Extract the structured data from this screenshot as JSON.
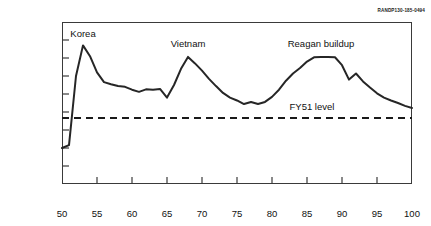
{
  "doc_code": "RANDP130-185-0494",
  "chart_data": {
    "type": "line",
    "title": "",
    "xlabel": "Fiscal year",
    "ylabel_line1": "National defense outlays",
    "ylabel_line2": "(billions, 1993$)",
    "xlim": [
      50,
      100
    ],
    "ylim": [
      0,
      450
    ],
    "xticks": [
      50,
      55,
      60,
      65,
      70,
      75,
      80,
      85,
      90,
      95,
      100
    ],
    "yticks": [
      0,
      50,
      100,
      150,
      200,
      250,
      300,
      350,
      400,
      450
    ],
    "grid": false,
    "legend": "none",
    "line_color": "#262626",
    "reference_line": {
      "label": "FY51 level",
      "value": 183,
      "style": "dashed",
      "color": "#1a1a1a"
    },
    "annotations": [
      {
        "text": "Korea",
        "x": 53,
        "y": 420
      },
      {
        "text": "Vietnam",
        "x": 68,
        "y": 393
      },
      {
        "text": "Reagan buildup",
        "x": 87,
        "y": 393
      }
    ],
    "series": [
      {
        "name": "National defense outlays",
        "x": [
          50,
          51,
          52,
          53,
          54,
          55,
          56,
          57,
          58,
          59,
          60,
          61,
          62,
          63,
          64,
          65,
          66,
          67,
          68,
          69,
          70,
          71,
          72,
          73,
          74,
          75,
          76,
          77,
          78,
          79,
          80,
          81,
          82,
          83,
          84,
          85,
          86,
          87,
          88,
          89,
          90,
          91,
          92,
          93,
          94,
          95,
          96,
          97,
          98,
          99,
          100
        ],
        "values": [
          100,
          108,
          300,
          385,
          355,
          310,
          283,
          277,
          272,
          270,
          262,
          256,
          263,
          262,
          264,
          240,
          275,
          320,
          353,
          335,
          315,
          292,
          272,
          253,
          240,
          232,
          222,
          228,
          222,
          228,
          242,
          262,
          287,
          307,
          322,
          340,
          352,
          353,
          353,
          352,
          330,
          290,
          307,
          285,
          268,
          252,
          240,
          232,
          225,
          217,
          211
        ]
      }
    ]
  }
}
